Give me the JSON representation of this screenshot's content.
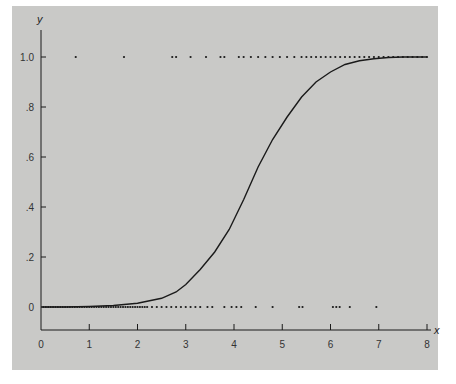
{
  "chart_data": {
    "type": "scatter",
    "title": "",
    "xlabel": "x",
    "ylabel": "y",
    "xlim": [
      0,
      8
    ],
    "ylim": [
      0,
      1.0
    ],
    "x_ticks": [
      "0",
      "1",
      "2",
      "3",
      "4",
      "5",
      "6",
      "7",
      "8"
    ],
    "y_ticks": [
      "0",
      ".2",
      ".4",
      ".6",
      ".8",
      "1.0"
    ],
    "grid": false,
    "legend": null,
    "series": [
      {
        "name": "logistic curve",
        "kind": "line",
        "x": [
          0,
          0.5,
          1,
          1.5,
          2,
          2.5,
          2.8,
          3,
          3.3,
          3.6,
          3.9,
          4.2,
          4.5,
          4.8,
          5.1,
          5.4,
          5.7,
          6,
          6.3,
          6.6,
          6.9,
          7.2,
          7.5,
          8
        ],
        "y": [
          0.0,
          0.0,
          0.002,
          0.006,
          0.015,
          0.035,
          0.06,
          0.09,
          0.15,
          0.22,
          0.31,
          0.43,
          0.56,
          0.67,
          0.76,
          0.84,
          0.9,
          0.94,
          0.97,
          0.985,
          0.993,
          0.998,
          1.0,
          1.0
        ]
      },
      {
        "name": "observations y=0",
        "kind": "points",
        "y_value": 0,
        "x": [
          0.05,
          0.1,
          0.15,
          0.2,
          0.25,
          0.3,
          0.35,
          0.4,
          0.45,
          0.5,
          0.55,
          0.6,
          0.65,
          0.7,
          0.75,
          0.8,
          0.85,
          0.9,
          0.95,
          1.0,
          1.05,
          1.1,
          1.15,
          1.2,
          1.25,
          1.3,
          1.35,
          1.4,
          1.45,
          1.5,
          1.55,
          1.6,
          1.65,
          1.7,
          1.75,
          1.8,
          1.85,
          1.9,
          1.95,
          2.0,
          2.05,
          2.1,
          2.15,
          2.2,
          2.3,
          2.4,
          2.5,
          2.6,
          2.7,
          2.8,
          2.9,
          3.0,
          3.1,
          3.2,
          3.3,
          3.45,
          3.55,
          3.8,
          3.95,
          4.05,
          4.15,
          4.45,
          4.8,
          5.35,
          5.42,
          6.05,
          6.12,
          6.19,
          6.4,
          6.95
        ]
      },
      {
        "name": "observations y=1",
        "kind": "points",
        "y_value": 1,
        "x": [
          0.72,
          1.72,
          2.72,
          2.8,
          3.1,
          3.42,
          3.72,
          3.8,
          4.1,
          4.2,
          4.35,
          4.5,
          4.65,
          4.8,
          4.95,
          5.1,
          5.25,
          5.4,
          5.5,
          5.6,
          5.7,
          5.8,
          5.9,
          6.0,
          6.1,
          6.2,
          6.3,
          6.4,
          6.5,
          6.6,
          6.7,
          6.8,
          6.9,
          7.0,
          7.1,
          7.2,
          7.3,
          7.4,
          7.5,
          7.6,
          7.7,
          7.8,
          7.9,
          8.0
        ]
      }
    ]
  },
  "axes": {
    "x_label": "x",
    "y_label": "y",
    "x_tick_labels": [
      "0",
      "1",
      "2",
      "3",
      "4",
      "5",
      "6",
      "7",
      "8"
    ],
    "y_tick_labels": [
      "0",
      ".2",
      ".4",
      ".6",
      ".8",
      "1.0"
    ]
  },
  "colors": {
    "background": "#c9c9c7",
    "ink": "#1a1a1a"
  }
}
